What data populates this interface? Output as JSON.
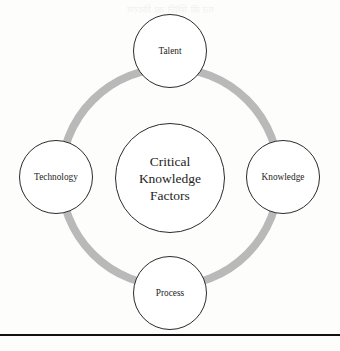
{
  "figure": {
    "center": {
      "label": "Critical Knowledge Factors",
      "line1": "Critical",
      "line2": "Knowledge",
      "line3": "Factors"
    },
    "nodes": [
      {
        "id": "talent",
        "label": "Talent",
        "position": "top"
      },
      {
        "id": "knowledge",
        "label": "Knowledge",
        "position": "right"
      },
      {
        "id": "process",
        "label": "Process",
        "position": "bottom"
      },
      {
        "id": "technology",
        "label": "Technology",
        "position": "left"
      }
    ],
    "ring": {
      "color": "#b9b9b9",
      "thickness_px": 8
    },
    "colors": {
      "outline": "#2b2b2b",
      "ring": "#b9b9b9",
      "text": "#1d1d1d",
      "rule": "#111111",
      "background": "#fdfdfc"
    },
    "bleed_text": "गत की स्थिति का विवरण"
  }
}
